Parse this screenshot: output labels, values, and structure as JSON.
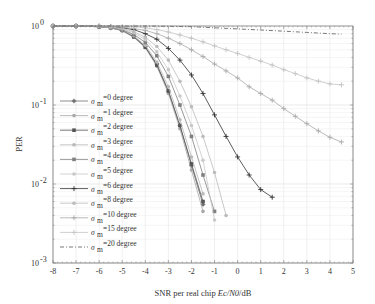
{
  "chart_data": {
    "type": "line",
    "title": "",
    "xlabel": "SNR per real chip Ec/N0/dB",
    "ylabel": "PER",
    "xlim": [
      -8,
      5
    ],
    "ylim": [
      0.001,
      1
    ],
    "yscale": "log",
    "grid": true,
    "legend_position": "left-center inside",
    "x_ticks": [
      "-8",
      "-7",
      "-6",
      "-5",
      "-4",
      "-3",
      "-2",
      "-1",
      "0",
      "1",
      "2",
      "3",
      "4",
      "5"
    ],
    "y_ticks": [
      "10^0",
      "10^-1",
      "10^-2",
      "10^-3"
    ],
    "series": [
      {
        "name": "σm=0 degree",
        "color": "#707070",
        "marker": "dot-plus",
        "x": [
          -8,
          -7,
          -6,
          -5.5,
          -5,
          -4.5,
          -4,
          -3.5,
          -3,
          -2.5,
          -2,
          -1.5
        ],
        "y": [
          1,
          1,
          0.98,
          0.95,
          0.88,
          0.74,
          0.55,
          0.33,
          0.15,
          0.055,
          0.017,
          0.0055
        ]
      },
      {
        "name": "σm=1 degree",
        "color": "#a8a8a8",
        "marker": "dot",
        "x": [
          -8,
          -7,
          -6,
          -5.5,
          -5,
          -4.5,
          -4,
          -3.5,
          -3,
          -2.5,
          -2,
          -1.5
        ],
        "y": [
          1,
          1,
          0.98,
          0.95,
          0.87,
          0.72,
          0.53,
          0.31,
          0.14,
          0.05,
          0.015,
          0.0045
        ]
      },
      {
        "name": "σm=2 degree",
        "color": "#555555",
        "marker": "square",
        "x": [
          -8,
          -7,
          -6,
          -5.5,
          -5,
          -4.5,
          -4,
          -3.5,
          -3,
          -2.5,
          -2,
          -1.5
        ],
        "y": [
          1,
          1,
          0.98,
          0.95,
          0.88,
          0.73,
          0.54,
          0.32,
          0.15,
          0.055,
          0.018,
          0.006
        ]
      },
      {
        "name": "σm=3 degree",
        "color": "#b8b8b8",
        "marker": "dot",
        "x": [
          -8,
          -7,
          -6,
          -5.5,
          -5,
          -4.5,
          -4,
          -3.5,
          -3,
          -2.5,
          -2,
          -1.5
        ],
        "y": [
          1,
          1,
          0.98,
          0.95,
          0.89,
          0.75,
          0.57,
          0.35,
          0.17,
          0.065,
          0.022,
          0.0075
        ]
      },
      {
        "name": "σm=4 degree",
        "color": "#808080",
        "marker": "square",
        "x": [
          -8,
          -7,
          -6,
          -5.5,
          -5,
          -4.5,
          -4,
          -3.5,
          -3,
          -2.5,
          -2,
          -1.5,
          -1
        ],
        "y": [
          1,
          1,
          0.98,
          0.96,
          0.9,
          0.78,
          0.62,
          0.42,
          0.23,
          0.1,
          0.04,
          0.013,
          0.0045
        ]
      },
      {
        "name": "σm=5 degree",
        "color": "#c8c8c8",
        "marker": "dot",
        "x": [
          -8,
          -7,
          -6,
          -5.5,
          -5,
          -4.5,
          -4,
          -3.5,
          -3,
          -2.5,
          -2,
          -1.5,
          -1
        ],
        "y": [
          1,
          1,
          0.99,
          0.97,
          0.92,
          0.82,
          0.67,
          0.47,
          0.28,
          0.13,
          0.055,
          0.02,
          0.0035
        ]
      },
      {
        "name": "σm=6 degree",
        "color": "#333333",
        "marker": "plus",
        "x": [
          -8,
          -7,
          -6,
          -5.5,
          -5,
          -4.5,
          -4,
          -3.5,
          -3,
          -2.5,
          -2,
          -1.5,
          -1,
          -0.5,
          0,
          0.5,
          1,
          1.5
        ],
        "y": [
          1,
          1,
          0.99,
          0.98,
          0.95,
          0.9,
          0.8,
          0.68,
          0.52,
          0.37,
          0.24,
          0.14,
          0.075,
          0.04,
          0.022,
          0.013,
          0.0085,
          0.0068
        ]
      },
      {
        "name": "σm=8 degree",
        "color": "#bbbbbb",
        "marker": "dot",
        "x": [
          -8,
          -7,
          -6,
          -5.5,
          -5,
          -4.5,
          -4,
          -3.5,
          -3,
          -2.5,
          -2,
          -1.5,
          -1,
          -0.5
        ],
        "y": [
          1,
          1,
          0.99,
          0.97,
          0.93,
          0.85,
          0.72,
          0.55,
          0.37,
          0.2,
          0.095,
          0.04,
          0.014,
          0.004
        ]
      },
      {
        "name": "σm=10 degree",
        "color": "#aaaaaa",
        "marker": "plus",
        "x": [
          -8,
          -7,
          -6,
          -5.5,
          -5,
          -4.5,
          -4,
          -3.5,
          -3,
          -2.5,
          -2,
          -1.5,
          -1,
          -0.5,
          0,
          0.5,
          1,
          1.5,
          2,
          2.5,
          3,
          3.5,
          4,
          4.5
        ],
        "y": [
          1,
          1,
          1,
          0.99,
          0.97,
          0.93,
          0.88,
          0.8,
          0.7,
          0.6,
          0.5,
          0.41,
          0.33,
          0.27,
          0.22,
          0.17,
          0.14,
          0.115,
          0.09,
          0.072,
          0.058,
          0.047,
          0.039,
          0.034
        ]
      },
      {
        "name": "σm=15 degree",
        "color": "#c4c4c4",
        "marker": "plus",
        "x": [
          -8,
          -7,
          -6,
          -5,
          -4.5,
          -4,
          -3.5,
          -3,
          -2.5,
          -2,
          -1.5,
          -1,
          -0.5,
          0,
          0.5,
          1,
          1.5,
          2,
          2.5,
          3,
          3.5,
          4,
          4.5
        ],
        "y": [
          1,
          1,
          1,
          0.99,
          0.98,
          0.95,
          0.9,
          0.84,
          0.77,
          0.7,
          0.63,
          0.56,
          0.5,
          0.45,
          0.4,
          0.36,
          0.32,
          0.28,
          0.25,
          0.22,
          0.2,
          0.185,
          0.18
        ]
      },
      {
        "name": "σm=20 degree",
        "color": "#555555",
        "marker": "dash-dot",
        "x": [
          -8,
          -7,
          -6,
          -5,
          -4,
          -3,
          -2,
          -1,
          0,
          1,
          2,
          3,
          4,
          4.5
        ],
        "y": [
          1,
          1,
          1,
          1,
          1,
          0.99,
          0.98,
          0.95,
          0.92,
          0.89,
          0.86,
          0.83,
          0.8,
          0.79
        ]
      }
    ]
  },
  "legend": {
    "items": [
      {
        "sym": "σ",
        "sub": "m",
        "text": "=0 degree"
      },
      {
        "sym": "σ",
        "sub": "m",
        "text": "=1 degree"
      },
      {
        "sym": "σ",
        "sub": "m",
        "text": "=2 degree"
      },
      {
        "sym": "σ",
        "sub": "m",
        "text": "=3 degree"
      },
      {
        "sym": "σ",
        "sub": "m",
        "text": "=4 degree"
      },
      {
        "sym": "σ",
        "sub": "m",
        "text": "=5 degree"
      },
      {
        "sym": "σ",
        "sub": "m",
        "text": "=6 degree"
      },
      {
        "sym": "σ",
        "sub": "m",
        "text": "=8 degree"
      },
      {
        "sym": "σ",
        "sub": "m",
        "text": "=10 degree"
      },
      {
        "sym": "σ",
        "sub": "m",
        "text": "=15 degree"
      },
      {
        "sym": "σ",
        "sub": "m",
        "text": "=20 degree"
      }
    ]
  },
  "axes": {
    "xlabel_prefix": "SNR per real chip ",
    "xlabel_italic": "Ec/N0",
    "xlabel_suffix": "/dB",
    "ylabel": "PER",
    "y_tick_base": "10",
    "y_tick_exps": [
      "0",
      "-1",
      "-2",
      "-3"
    ]
  }
}
